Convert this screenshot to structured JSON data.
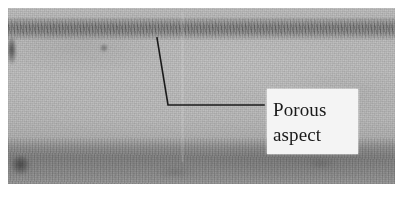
{
  "figure": {
    "type": "micrograph-photograph",
    "width": 402,
    "height": 197,
    "plate": {
      "left": 8,
      "top": 8,
      "width": 387,
      "height": 176,
      "base_color": "#b9b9b9",
      "upper_tone": "#c1c1c1",
      "lower_band_tone": "#9c9c9c"
    },
    "page_background": "#ffffff"
  },
  "annotation": {
    "leader_line": {
      "color": "#1b1b1b",
      "stroke_width": 1.6,
      "points": [
        {
          "x": 157,
          "y": 38
        },
        {
          "x": 168,
          "y": 105
        },
        {
          "x": 264,
          "y": 105
        }
      ]
    },
    "callout": {
      "lines": [
        "Porous",
        "aspect"
      ],
      "full_text": "Porous aspect",
      "text_color": "#1a1a1a",
      "box_color": "#f4f4f4",
      "box": {
        "left": 267,
        "top": 89,
        "width": 91,
        "height": 65
      }
    }
  },
  "features": {
    "porous_band": {
      "label": "porous aspect stratum",
      "top": 18,
      "height": 22,
      "tone": "#8c8c8c"
    },
    "lower_band": {
      "label": "darker substrate band",
      "top": 138,
      "height": 46,
      "tone": "#9c9c9c"
    },
    "defects": [
      {
        "name": "left-edge smudge",
        "x": 8,
        "y": 38,
        "w": 8,
        "h": 26
      },
      {
        "name": "bottom-left patch",
        "x": 11,
        "y": 156,
        "w": 19,
        "h": 19
      },
      {
        "name": "upper-mid blob",
        "x": 100,
        "y": 44,
        "w": 8,
        "h": 8
      },
      {
        "name": "mid-right streak",
        "x": 308,
        "y": 158,
        "w": 26,
        "h": 10
      },
      {
        "name": "bottom-center streak",
        "x": 158,
        "y": 168,
        "w": 34,
        "h": 9
      }
    ]
  }
}
